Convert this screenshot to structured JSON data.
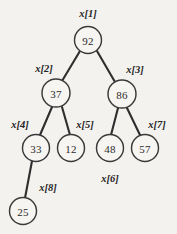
{
  "figure": {
    "kind": "binary-heap-tree",
    "background_color": "#f4f2ef",
    "node_fill_color": "#f7f5f2",
    "node_stroke_color": "#3a3a3a",
    "edge_color": "#2e2e2e",
    "label_color": "#232323"
  },
  "nodes": [
    {
      "id": "n1",
      "value": "92",
      "index_label": "x[1]",
      "cx": 88,
      "cy": 40,
      "r": 13.5,
      "label_x": 88,
      "label_y": 13,
      "label_pos": "above"
    },
    {
      "id": "n2",
      "value": "37",
      "index_label": "x[2]",
      "cx": 56,
      "cy": 93,
      "r": 14,
      "label_x": 44,
      "label_y": 68,
      "label_pos": "upper-left"
    },
    {
      "id": "n3",
      "value": "86",
      "index_label": "x[3]",
      "cx": 122,
      "cy": 94,
      "r": 14,
      "label_x": 135,
      "label_y": 69,
      "label_pos": "upper-right"
    },
    {
      "id": "n4",
      "value": "33",
      "index_label": "x[4]",
      "cx": 36,
      "cy": 148,
      "r": 13.5,
      "label_x": 20,
      "label_y": 124,
      "label_pos": "upper-left"
    },
    {
      "id": "n5",
      "value": "12",
      "index_label": "x[5]",
      "cx": 71,
      "cy": 148,
      "r": 13.5,
      "label_x": 85,
      "label_y": 124,
      "label_pos": "upper-right"
    },
    {
      "id": "n6",
      "value": "48",
      "index_label": "x[6]",
      "cx": 110,
      "cy": 148,
      "r": 13.5,
      "label_x": 110,
      "label_y": 178,
      "label_pos": "below"
    },
    {
      "id": "n7",
      "value": "57",
      "index_label": "x[7]",
      "cx": 145,
      "cy": 148,
      "r": 13.5,
      "label_x": 157,
      "label_y": 124,
      "label_pos": "upper-right"
    },
    {
      "id": "n8",
      "value": "25",
      "index_label": "x[8]",
      "cx": 23,
      "cy": 211,
      "r": 13.5,
      "label_x": 48,
      "label_y": 187,
      "label_pos": "upper-right"
    }
  ],
  "edges": [
    {
      "id": "e1",
      "from": "n1",
      "to": "n2",
      "x1": 80,
      "y1": 51,
      "x2": 62,
      "y2": 81
    },
    {
      "id": "e2",
      "from": "n1",
      "to": "n3",
      "x1": 97,
      "y1": 51,
      "x2": 115,
      "y2": 82
    },
    {
      "id": "e3",
      "from": "n2",
      "to": "n4",
      "x1": 52,
      "y1": 107,
      "x2": 40,
      "y2": 135
    },
    {
      "id": "e4",
      "from": "n2",
      "to": "n5",
      "x1": 62,
      "y1": 107,
      "x2": 70,
      "y2": 135
    },
    {
      "id": "e5",
      "from": "n3",
      "to": "n6",
      "x1": 118,
      "y1": 108,
      "x2": 111,
      "y2": 135
    },
    {
      "id": "e6",
      "from": "n3",
      "to": "n7",
      "x1": 127,
      "y1": 108,
      "x2": 140,
      "y2": 135
    },
    {
      "id": "e7",
      "from": "n4",
      "to": "n8",
      "x1": 32,
      "y1": 161,
      "x2": 25,
      "y2": 198
    }
  ]
}
